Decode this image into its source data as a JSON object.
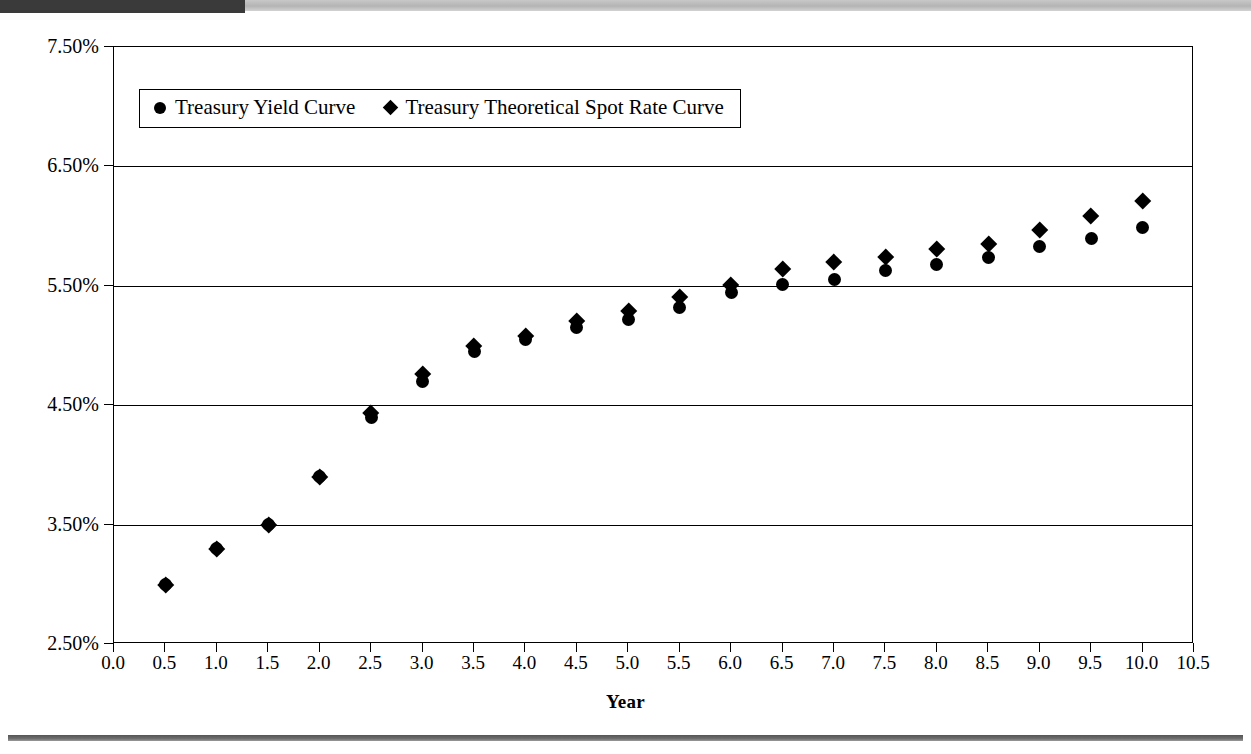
{
  "figure": {
    "x_axis_title": "Year",
    "y_tick_labels": [
      "7.50%",
      "6.50%",
      "5.50%",
      "4.50%",
      "3.50%",
      "2.50%"
    ],
    "x_tick_labels": [
      "0.0",
      "0.5",
      "1.0",
      "1.5",
      "2.0",
      "2.5",
      "3.0",
      "3.5",
      "4.0",
      "4.5",
      "5.0",
      "5.5",
      "6.0",
      "6.5",
      "7.0",
      "7.5",
      "8.0",
      "8.5",
      "9.0",
      "9.5",
      "10.0",
      "10.5"
    ],
    "legend": {
      "entries": [
        {
          "marker": "circle-marker-icon",
          "label": "Treasury Yield Curve"
        },
        {
          "marker": "diamond-marker-icon",
          "label": "Treasury Theoretical Spot Rate Curve"
        }
      ]
    }
  },
  "chart_data": {
    "type": "scatter",
    "title": "",
    "xlabel": "Year",
    "ylabel": "",
    "xlim": [
      0.0,
      10.5
    ],
    "ylim": [
      2.5,
      7.5
    ],
    "ytick_values": [
      7.5,
      6.5,
      5.5,
      4.5,
      3.5,
      2.5
    ],
    "ytick_format": "percent",
    "xtick_values": [
      0.0,
      0.5,
      1.0,
      1.5,
      2.0,
      2.5,
      3.0,
      3.5,
      4.0,
      4.5,
      5.0,
      5.5,
      6.0,
      6.5,
      7.0,
      7.5,
      8.0,
      8.5,
      9.0,
      9.5,
      10.0,
      10.5
    ],
    "grid": "horizontal",
    "legend_position": "top-left-inside",
    "x": [
      0.5,
      1.0,
      1.5,
      2.0,
      2.5,
      3.0,
      3.5,
      4.0,
      4.5,
      5.0,
      5.5,
      6.0,
      6.5,
      7.0,
      7.5,
      8.0,
      8.5,
      9.0,
      9.5,
      10.0
    ],
    "series": [
      {
        "name": "Treasury Yield Curve",
        "marker": "circle",
        "values": [
          3.0,
          3.3,
          3.5,
          3.9,
          4.4,
          4.7,
          4.95,
          5.05,
          5.15,
          5.22,
          5.32,
          5.44,
          5.51,
          5.55,
          5.63,
          5.68,
          5.74,
          5.83,
          5.9,
          5.99
        ]
      },
      {
        "name": "Treasury Theoretical Spot Rate Curve",
        "marker": "diamond",
        "values": [
          3.0,
          3.3,
          3.5,
          3.9,
          4.44,
          4.76,
          5.0,
          5.08,
          5.21,
          5.29,
          5.41,
          5.51,
          5.64,
          5.7,
          5.74,
          5.81,
          5.85,
          5.97,
          6.09,
          6.21
        ]
      }
    ]
  }
}
